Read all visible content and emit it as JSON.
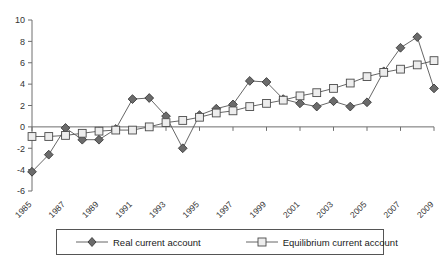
{
  "chart_data": {
    "type": "line",
    "title": "",
    "subtitle": "",
    "xlabel": "",
    "ylabel": "",
    "grid": false,
    "legend_position": "bottom",
    "x": [
      1985,
      1986,
      1987,
      1988,
      1989,
      1990,
      1991,
      1992,
      1993,
      1994,
      1995,
      1996,
      1997,
      1998,
      1999,
      2000,
      2001,
      2002,
      2003,
      2004,
      2005,
      2006,
      2007,
      2008,
      2009
    ],
    "x_tick_labels": [
      "1985",
      "1987",
      "1989",
      "1991",
      "1993",
      "1995",
      "1997",
      "1999",
      "2001",
      "2003",
      "2005",
      "2007",
      "2009"
    ],
    "x_tick_values": [
      1985,
      1987,
      1989,
      1991,
      1993,
      1995,
      1997,
      1999,
      2001,
      2003,
      2005,
      2007,
      2009
    ],
    "xlim": [
      1985,
      2009
    ],
    "ylim": [
      -6,
      10
    ],
    "y_tick_values": [
      -6,
      -4,
      -2,
      0,
      2,
      4,
      6,
      8,
      10
    ],
    "y_tick_labels": [
      "-6",
      "-4",
      "-2",
      "0",
      "2",
      "4",
      "6",
      "8",
      "10"
    ],
    "series": [
      {
        "name": "Real current account",
        "marker": "filled-diamond",
        "color": "#6b6b6b",
        "values": [
          -4.2,
          -2.6,
          -0.1,
          -1.2,
          -1.2,
          -0.2,
          2.6,
          2.7,
          1.0,
          -2.0,
          1.1,
          1.7,
          2.1,
          4.3,
          4.2,
          2.6,
          2.2,
          1.9,
          2.4,
          1.9,
          2.3,
          5.2,
          7.4,
          8.4,
          3.6
        ]
      },
      {
        "name": "Equilibrium current account",
        "marker": "open-square",
        "color": "#ededed",
        "values": [
          -0.9,
          -0.9,
          -0.8,
          -0.6,
          -0.4,
          -0.3,
          -0.3,
          0.0,
          0.4,
          0.6,
          0.9,
          1.3,
          1.5,
          1.9,
          2.2,
          2.5,
          2.9,
          3.2,
          3.6,
          4.1,
          4.7,
          5.1,
          5.4,
          5.8,
          6.2
        ]
      }
    ]
  },
  "legend": {
    "entries": [
      {
        "label": "Real current account",
        "marker": "filled-diamond"
      },
      {
        "label": "Equilibrium current account",
        "marker": "open-square"
      }
    ]
  }
}
